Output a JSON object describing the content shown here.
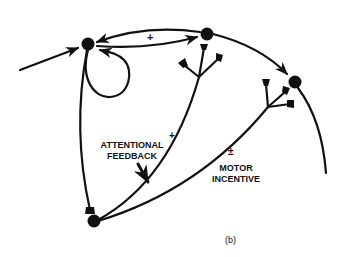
{
  "figure": {
    "panel_label": "(b)",
    "nodes": [
      {
        "id": "A",
        "name": "input-node"
      },
      {
        "id": "B",
        "name": "top-node"
      },
      {
        "id": "C",
        "name": "right-node"
      },
      {
        "id": "D",
        "name": "bottom-node"
      }
    ],
    "labels": {
      "reciprocal_sign": "+",
      "attentional_sign": "+",
      "attentional_line1": "ATTENTIONAL",
      "attentional_line2": "FEEDBACK",
      "motor_sign": "±",
      "motor_line1": "MOTOR",
      "motor_line2": "INCENTIVE"
    }
  },
  "colors": {
    "ink": "#111111",
    "background": "#ffffff"
  }
}
